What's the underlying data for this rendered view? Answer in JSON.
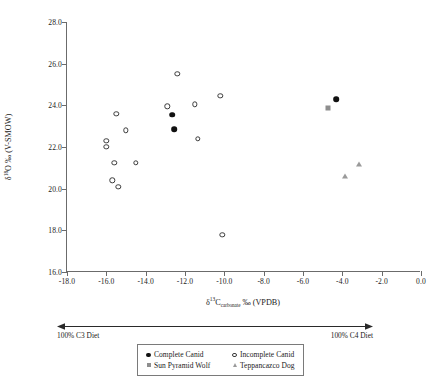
{
  "chart_data": {
    "type": "scatter",
    "title": "",
    "xlabel": "δ13Ccarbonate ‰ (VPDB)",
    "ylabel": "δ18O ‰ (V-SMOW)",
    "xlim": [
      -18.0,
      0.0
    ],
    "ylim": [
      16.0,
      28.0
    ],
    "xticks": [
      "-18.0",
      "-16.0",
      "-14.0",
      "-12.0",
      "-10.0",
      "-8.0",
      "-6.0",
      "-4.0",
      "-2.0",
      "0.0"
    ],
    "xtick_values": [
      -18.0,
      -16.0,
      -14.0,
      -12.0,
      -10.0,
      -8.0,
      -6.0,
      -4.0,
      -2.0,
      0.0
    ],
    "yticks": [
      "16.0",
      "18.0",
      "20.0",
      "22.0",
      "24.0",
      "26.0",
      "28.0"
    ],
    "ytick_values": [
      16.0,
      18.0,
      20.0,
      22.0,
      24.0,
      26.0,
      28.0
    ],
    "grid": false,
    "legend_position": "below-axes-center",
    "series": [
      {
        "name": "Complete Canid",
        "marker": "filled-circle",
        "color": "#111111",
        "points": [
          {
            "x": -12.65,
            "y": 23.55
          },
          {
            "x": -12.55,
            "y": 22.85
          },
          {
            "x": -4.3,
            "y": 24.3
          }
        ]
      },
      {
        "name": "Incomplete Canid",
        "marker": "open-circle",
        "color": "#3a3a3a",
        "points": [
          {
            "x": -15.5,
            "y": 23.6
          },
          {
            "x": -15.0,
            "y": 22.8
          },
          {
            "x": -16.0,
            "y": 22.3
          },
          {
            "x": -16.0,
            "y": 22.0
          },
          {
            "x": -15.6,
            "y": 21.25
          },
          {
            "x": -14.5,
            "y": 21.25
          },
          {
            "x": -15.7,
            "y": 20.4
          },
          {
            "x": -15.4,
            "y": 20.1
          },
          {
            "x": -12.9,
            "y": 23.95
          },
          {
            "x": -12.4,
            "y": 25.5
          },
          {
            "x": -11.5,
            "y": 24.05
          },
          {
            "x": -10.2,
            "y": 24.45
          },
          {
            "x": -11.35,
            "y": 22.4
          },
          {
            "x": -10.1,
            "y": 17.8
          }
        ]
      },
      {
        "name": "Sun Pyramid Wolf",
        "marker": "square",
        "color": "#8e8e8e",
        "points": [
          {
            "x": -4.75,
            "y": 23.85
          }
        ]
      },
      {
        "name": "Teppancazco Dog",
        "marker": "triangle",
        "color": "#9a9a9a",
        "points": [
          {
            "x": -3.15,
            "y": 21.2
          },
          {
            "x": -3.85,
            "y": 20.6
          }
        ]
      }
    ],
    "annotations": {
      "diet_axis_left": "100% C3 Diet",
      "diet_axis_right": "100% C4 Diet"
    }
  },
  "axis": {
    "y_title_delta": "δ",
    "y_title_sup": "18",
    "y_title_rest": "O ‰ (V-SMOW)",
    "x_title_delta": "δ",
    "x_title_sup": "13",
    "x_title_c": "C",
    "x_title_sub": "carbonate",
    "x_title_rest": " ‰ (VPDB)"
  },
  "legend": {
    "items": [
      {
        "label": "Complete Canid",
        "marker": "filled-circle"
      },
      {
        "label": "Incomplete Canid",
        "marker": "open-circle"
      },
      {
        "label": "Sun Pyramid Wolf",
        "marker": "square"
      },
      {
        "label": "Teppancazco Dog",
        "marker": "triangle"
      }
    ]
  }
}
